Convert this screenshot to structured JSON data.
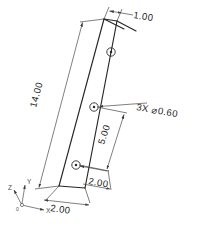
{
  "drawing": {
    "type": "engineering-part-drawing",
    "projection": "isometric",
    "background_color": "#ffffff",
    "line_color": "#262626",
    "dimension_color": "#3a3a3a",
    "part_description": "tapered flat strip with three holes"
  },
  "dimensions": {
    "overall_length": "14.00",
    "top_width": "1.00",
    "hole_spacing": "5.00",
    "hole_offset": "2.00",
    "bottom_width": "2.00"
  },
  "callout": {
    "quantity": "3X",
    "diameter": "⌀0.60",
    "full": "3X ⌀0.60"
  },
  "axis_triad": {
    "x_label": "X",
    "y_label": "Y",
    "z_label": "Z",
    "origin_label": "0"
  },
  "holes": [
    {
      "id": "hole-top",
      "label": "hole"
    },
    {
      "id": "hole-middle",
      "label": "hole"
    },
    {
      "id": "hole-bottom",
      "label": "hole"
    }
  ]
}
